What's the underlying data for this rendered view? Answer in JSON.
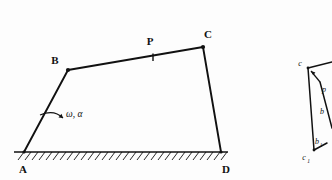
{
  "figure": {
    "type": "mechanism-kinematic-diagram",
    "background_color": "#fdfdfd",
    "ink_color": "#111111",
    "linkage": {
      "name": "four-bar-linkage",
      "joints": [
        {
          "id": "A",
          "label": "A",
          "x": 24,
          "y": 152,
          "kind": "fixed-pivot"
        },
        {
          "id": "B",
          "label": "B",
          "x": 68,
          "y": 70,
          "kind": "moving-pivot"
        },
        {
          "id": "P",
          "label": "P",
          "x": 153,
          "y": 57,
          "kind": "coupler-point"
        },
        {
          "id": "C",
          "label": "C",
          "x": 203,
          "y": 47,
          "kind": "moving-pivot"
        },
        {
          "id": "D",
          "label": "D",
          "x": 221,
          "y": 152,
          "kind": "fixed-pivot"
        }
      ],
      "links": [
        {
          "name": "crank-AB",
          "from": "A",
          "to": "B"
        },
        {
          "name": "coupler-BC",
          "from": "B",
          "to": "C"
        },
        {
          "name": "rocker-CD",
          "from": "C",
          "to": "D"
        }
      ],
      "ground": {
        "name": "ground-link-AD",
        "x_start": 14,
        "x_end": 228,
        "y": 152,
        "hatched": true
      },
      "annotation": {
        "name": "angular-velocity-acceleration",
        "label": "ω, α",
        "x": 62,
        "y": 113,
        "attached_to": "crank-AB"
      }
    },
    "velocity_diagram": {
      "name": "velocity-polygon-partial",
      "clipped_at_right_edge": true,
      "labels": [
        {
          "id": "c",
          "label": "c",
          "x": 301,
          "y": 64
        },
        {
          "id": "p",
          "label": "p",
          "x": 323,
          "y": 90
        },
        {
          "id": "b",
          "label": "b",
          "x": 321,
          "y": 112
        },
        {
          "id": "b1",
          "label": "b",
          "sub": "1",
          "x": 316,
          "y": 142
        },
        {
          "id": "c1",
          "label": "c",
          "sub": "1",
          "x": 307,
          "y": 157
        }
      ]
    }
  }
}
